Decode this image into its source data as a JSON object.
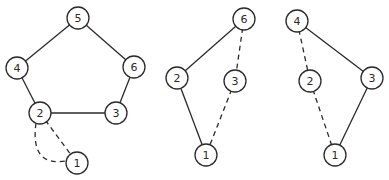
{
  "diagram": {
    "style": {
      "line_color": "#2a2a2a",
      "background": "#ffffff",
      "node_radius": 11
    },
    "graphs": [
      {
        "id": "graph-left",
        "nodes": [
          {
            "id": "5",
            "label": "5",
            "x": 78,
            "y": 18
          },
          {
            "id": "4",
            "label": "4",
            "x": 17,
            "y": 68
          },
          {
            "id": "6",
            "label": "6",
            "x": 134,
            "y": 67
          },
          {
            "id": "2",
            "label": "2",
            "x": 40,
            "y": 113
          },
          {
            "id": "3",
            "label": "3",
            "x": 116,
            "y": 113
          },
          {
            "id": "1",
            "label": "1",
            "x": 77,
            "y": 163
          }
        ],
        "edges": [
          {
            "from": "5",
            "to": "4",
            "style": "solid"
          },
          {
            "from": "5",
            "to": "6",
            "style": "solid"
          },
          {
            "from": "4",
            "to": "2",
            "style": "solid"
          },
          {
            "from": "6",
            "to": "3",
            "style": "solid"
          },
          {
            "from": "2",
            "to": "3",
            "style": "solid"
          },
          {
            "from": "2",
            "to": "1",
            "style": "dashed"
          },
          {
            "from": "2",
            "to": "1",
            "style": "dashed",
            "curved": true
          }
        ]
      },
      {
        "id": "graph-middle",
        "nodes": [
          {
            "id": "6",
            "label": "6",
            "x": 244,
            "y": 19
          },
          {
            "id": "2",
            "label": "2",
            "x": 177,
            "y": 78
          },
          {
            "id": "3",
            "label": "3",
            "x": 235,
            "y": 81
          },
          {
            "id": "1",
            "label": "1",
            "x": 206,
            "y": 155
          }
        ],
        "edges": [
          {
            "from": "6",
            "to": "2",
            "style": "solid"
          },
          {
            "from": "2",
            "to": "1",
            "style": "solid"
          },
          {
            "from": "6",
            "to": "3",
            "style": "dashed"
          },
          {
            "from": "3",
            "to": "1",
            "style": "dashed"
          }
        ]
      },
      {
        "id": "graph-right",
        "nodes": [
          {
            "id": "4",
            "label": "4",
            "x": 297,
            "y": 21
          },
          {
            "id": "2",
            "label": "2",
            "x": 310,
            "y": 81
          },
          {
            "id": "3",
            "label": "3",
            "x": 372,
            "y": 78
          },
          {
            "id": "1",
            "label": "1",
            "x": 335,
            "y": 155
          }
        ],
        "edges": [
          {
            "from": "4",
            "to": "3",
            "style": "solid"
          },
          {
            "from": "3",
            "to": "1",
            "style": "solid"
          },
          {
            "from": "4",
            "to": "2",
            "style": "dashed"
          },
          {
            "from": "2",
            "to": "1",
            "style": "dashed"
          }
        ]
      }
    ]
  }
}
